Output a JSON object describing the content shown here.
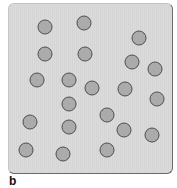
{
  "figure": {
    "panel_label": "b",
    "colors": {
      "panel_background": "#d9d9d9",
      "particle_fill": "#ababab",
      "particle_outline": "#4e4e4e"
    },
    "particles": [
      {
        "x": 45,
        "y": 27
      },
      {
        "x": 84,
        "y": 23
      },
      {
        "x": 139,
        "y": 38
      },
      {
        "x": 45,
        "y": 54
      },
      {
        "x": 85,
        "y": 54
      },
      {
        "x": 132,
        "y": 62
      },
      {
        "x": 155,
        "y": 69
      },
      {
        "x": 37,
        "y": 80
      },
      {
        "x": 69,
        "y": 80
      },
      {
        "x": 92,
        "y": 88
      },
      {
        "x": 125,
        "y": 89
      },
      {
        "x": 157,
        "y": 99
      },
      {
        "x": 69,
        "y": 104
      },
      {
        "x": 107,
        "y": 115
      },
      {
        "x": 30,
        "y": 122
      },
      {
        "x": 69,
        "y": 127
      },
      {
        "x": 124,
        "y": 130
      },
      {
        "x": 152,
        "y": 135
      },
      {
        "x": 26,
        "y": 150
      },
      {
        "x": 63,
        "y": 154
      },
      {
        "x": 107,
        "y": 150
      }
    ]
  }
}
